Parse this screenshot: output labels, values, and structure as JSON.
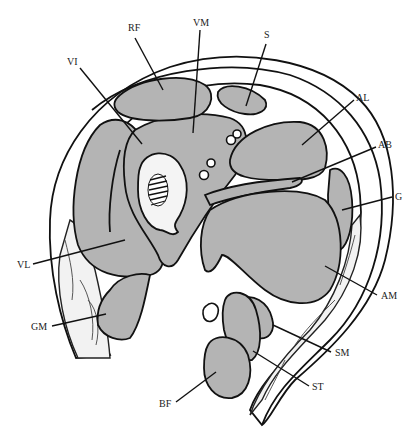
{
  "figure": {
    "colors": {
      "muscle_fill": "#b4b4b4",
      "outline": "#111111",
      "background": "#ffffff",
      "fat": "#f2f2f2"
    }
  },
  "labels": {
    "RF": "RF",
    "VM": "VM",
    "S": "S",
    "VI": "VI",
    "AL": "AL",
    "AB": "AB",
    "G": "G",
    "VL": "VL",
    "AM": "AM",
    "GM": "GM",
    "SM": "SM",
    "ST": "ST",
    "BF": "BF"
  }
}
